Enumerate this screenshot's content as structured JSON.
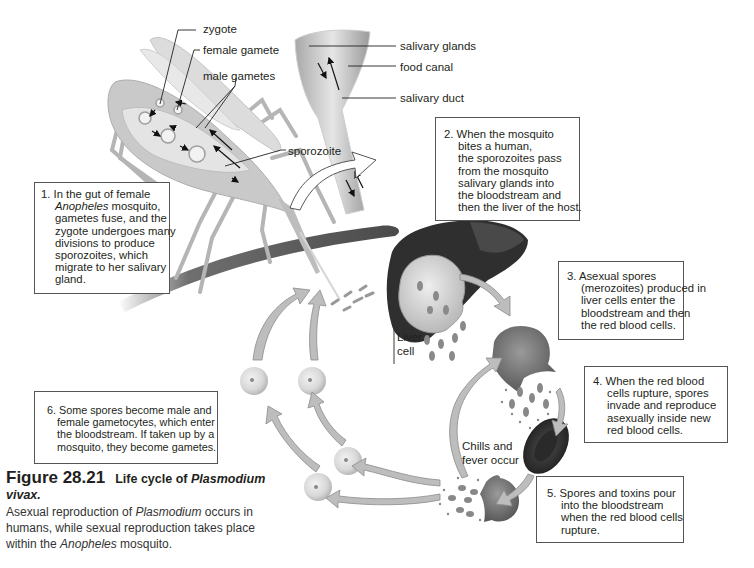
{
  "figure": {
    "number": "Figure 28.21",
    "title_prefix": "Life cycle of ",
    "title_italic": "Plasmodium",
    "title_line2": "vivax.",
    "body_1": "Asexual reproduction of ",
    "body_italic_1": "Plasmodium",
    "body_2": " occurs in",
    "body_3": "humans, while sexual reproduction takes place",
    "body_4": "within the ",
    "body_italic_2": "Anopheles",
    "body_5": " mosquito."
  },
  "labels": {
    "zygote": "zygote",
    "female_gamete": "female gamete",
    "male_gametes": "male gametes",
    "sporozoite": "sporozoite",
    "salivary_glands": "salivary glands",
    "food_canal": "food canal",
    "salivary_duct": "salivary duct",
    "liver_cell_1": "Liver",
    "liver_cell_2": "cell",
    "chills_1": "Chills and",
    "chills_2": "fever occur"
  },
  "steps": [
    {
      "lines": [
        "1. In the gut of female",
        "Mosquito, Anopheles",
        "gametes fuse, and the",
        "zygote undergoes many",
        "divisions to produce",
        "sporozoites, which",
        "migrate to her salivary",
        "gland."
      ],
      "italic_word": "Anopheles",
      "line2_rest": " mosquito,"
    },
    {
      "lines": [
        "2. When the mosquito",
        "bites a human,",
        "the sporozoites pass",
        "from the mosquito",
        "salivary glands into",
        "the bloodstream and",
        "then the liver of the host."
      ]
    },
    {
      "lines": [
        "3. Asexual spores",
        "(merozoites) produced in",
        "liver cells enter the",
        "bloodstream and then",
        "the red blood cells."
      ]
    },
    {
      "lines": [
        "4. When the red blood",
        "cells rupture, spores",
        "invade and reproduce",
        "asexually inside new",
        "red blood cells."
      ]
    },
    {
      "lines": [
        "5. Spores and toxins pour",
        "into the bloodstream",
        "when the red blood cells",
        "rupture."
      ]
    },
    {
      "lines": [
        "6. Some spores become male and",
        "female gametocytes, which enter",
        "the bloodstream. If taken up by a",
        "mosquito, they become gametes."
      ]
    }
  ],
  "colors": {
    "arrow_fill": "#b9b9b9",
    "arrow_stroke": "#8a8a8a",
    "liver": "#2f2f2f",
    "cell": "#d9d9d9",
    "rbc": "#3a3a3a",
    "mosquito": "#c8c8c8"
  }
}
